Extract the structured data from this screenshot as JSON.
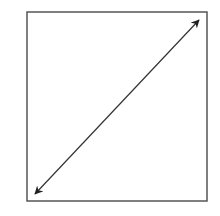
{
  "diagram": {
    "frame": {
      "x": 27,
      "y": 12,
      "width": 180,
      "height": 189,
      "stroke": "#555555",
      "stroke_width": 1.5
    },
    "arrow": {
      "type": "double-headed",
      "start": {
        "x": 35,
        "y": 194
      },
      "end": {
        "x": 199,
        "y": 20
      },
      "stroke": "#333333",
      "stroke_width": 1.2,
      "head_color": "#222222"
    }
  }
}
